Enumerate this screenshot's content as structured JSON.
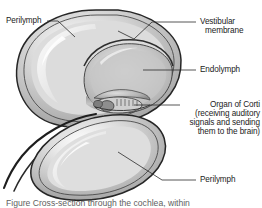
{
  "figure": {
    "type": "anatomical-cross-section",
    "subject": "cochlea",
    "background_color": "#ffffff",
    "ink_color": "#1b1b1b",
    "fill_light": "#e2e2e2",
    "fill_mid": "#c9c9c9",
    "fill_dark": "#9a9a9a",
    "outline_color": "#2a2a2a"
  },
  "labels": {
    "perilymph_top": "Perilymph",
    "vestibular_membrane_line1": "Vestibular",
    "vestibular_membrane_line2": "membrane",
    "endolymph": "Endolymph",
    "organ_of_corti_line1": "Organ of Corti",
    "organ_of_corti_line2": "(receiving auditory",
    "organ_of_corti_line3": "signals and sending",
    "organ_of_corti_line4": "them to the brain)",
    "perilymph_bottom": "Perilymph"
  },
  "caption": {
    "text": "Figure    Cross-section through the cochlea, within"
  },
  "structures": [
    {
      "name": "upper-chamber-perilymph",
      "label": "Perilymph"
    },
    {
      "name": "inner-chamber-endolymph",
      "label": "Endolymph"
    },
    {
      "name": "vestibular-membrane",
      "label": "Vestibular membrane"
    },
    {
      "name": "organ-of-corti",
      "label": "Organ of Corti"
    },
    {
      "name": "lower-chamber-perilymph",
      "label": "Perilymph"
    }
  ]
}
